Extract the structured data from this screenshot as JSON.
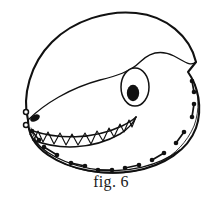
{
  "figure": {
    "caption": "fig. 6",
    "title": "Dinosaur head mask pattern illustration",
    "colors": {
      "ink": "#111111",
      "background": "#ffffff",
      "pupil": "#111111",
      "nostril": "#111111",
      "stitch": "#111111"
    },
    "line_weights": {
      "outline": 2.1,
      "seam": 1.3,
      "teeth": 1.2,
      "stitch_thread": 1.6
    },
    "parts": [
      {
        "name": "head-outline",
        "label": "Head outline"
      },
      {
        "name": "hood-seam",
        "label": "Hood seam"
      },
      {
        "name": "eye",
        "label": "Eye"
      },
      {
        "name": "pupil",
        "label": "Pupil"
      },
      {
        "name": "nostril",
        "label": "Nostril"
      },
      {
        "name": "mouth",
        "label": "Mouth line"
      },
      {
        "name": "teeth",
        "label": "Teeth"
      },
      {
        "name": "jaw-line",
        "label": "Lower jaw line"
      },
      {
        "name": "stitch-marks",
        "label": "Stitch marks"
      }
    ],
    "eye": {
      "cx": 135,
      "cy": 87,
      "rx": 14,
      "ry": 19
    },
    "pupil": {
      "cx": 133,
      "cy": 93,
      "rx": 6.2,
      "ry": 8.2
    },
    "nostril": {
      "cx": 35,
      "cy": 118,
      "rx": 5.2,
      "ry": 3.2,
      "rotation": -28
    },
    "teeth_count": 13,
    "stitch_pair_count": 9,
    "stitch_dot_radius": 2.3,
    "outline_path": "M 28 120 C 22 96 30 64 52 42 C 74 20 108 10 136 13 C 166 16 190 36 196 62 L 188 72 C 198 86 203 108 196 128 C 188 150 164 166 134 171 C 104 176 70 170 48 155 C 32 144 28 132 28 120 Z",
    "seam_path": "M 28 120 C 44 104 70 88 100 80 C 116 76 130 72 140 62 C 150 52 162 50 174 56 C 184 61 190 67 196 62",
    "mouth_path": "M 33 131 C 58 139 92 140 122 126 C 128 123 133 120 136 117",
    "jaw_path": "M 30 134 C 40 152 66 166 100 170 C 128 173 158 166 180 150",
    "lower_mouth_path": "M 33 140 C 58 150 92 150 120 134 C 128 129 133 124 136 117",
    "stitch_thread_path": "M 31 128 C 36 152 64 170 104 173 C 146 176 180 158 194 126 C 200 110 199 92 193 80",
    "stitch_pairs": [
      {
        "x1": 32,
        "y1": 131,
        "x2": 39,
        "y2": 140
      },
      {
        "x1": 44,
        "y1": 147,
        "x2": 57,
        "y2": 155
      },
      {
        "x1": 71,
        "y1": 163,
        "x2": 85,
        "y2": 166
      },
      {
        "x1": 98,
        "y1": 170,
        "x2": 112,
        "y2": 170
      },
      {
        "x1": 125,
        "y1": 168,
        "x2": 139,
        "y2": 165
      },
      {
        "x1": 152,
        "y1": 160,
        "x2": 164,
        "y2": 153
      },
      {
        "x1": 176,
        "y1": 143,
        "x2": 184,
        "y2": 132
      },
      {
        "x1": 192,
        "y1": 117,
        "x2": 194,
        "y2": 104
      },
      {
        "x1": 194,
        "y1": 92,
        "x2": 192,
        "y2": 81
      }
    ],
    "snout_stitches": [
      {
        "cx": 26,
        "cy": 112
      },
      {
        "cx": 26,
        "cy": 125
      }
    ]
  }
}
